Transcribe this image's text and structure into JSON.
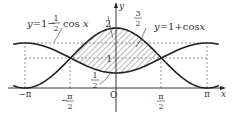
{
  "chart_data": {
    "type": "line",
    "title": "",
    "xlabel": "x",
    "ylabel": "y",
    "series": [
      {
        "name": "y=1+cos x",
        "expression": "1+cos(x)",
        "label": "y=1+cos x"
      },
      {
        "name": "y=1-1/2 cos x",
        "expression": "1-0.5*cos(x)",
        "label": "y=1-1/2 cos x"
      }
    ],
    "shaded_region": {
      "between": [
        "y=1+cos x",
        "y=1-1/2 cos x"
      ],
      "x_range": [
        "-π/2",
        "π/2"
      ],
      "pattern": "hatched"
    },
    "x_ticks": [
      "-π",
      "-π/2",
      "O",
      "π/2",
      "π"
    ],
    "y_ticks": [
      "1/2",
      "1",
      "3/2",
      "2"
    ],
    "xlim": [
      -3.4,
      3.5
    ],
    "ylim": [
      -0.6,
      2.7
    ],
    "grid": false,
    "guides": "dashed lines at y=1/2(not), y=1, y=3/2 and vertical at x=±π/2, ±π"
  },
  "labels": {
    "curve_a_prefix": "y=1−",
    "curve_a_num": "1",
    "curve_a_den": "2",
    "curve_a_suffix": "cos x",
    "curve_b": "y=1+cos x",
    "three_halves_num": "3",
    "three_halves_den": "2",
    "half_num": "1",
    "half_den": "2",
    "two": "2",
    "one": "1",
    "origin": "O",
    "x_axis": "x",
    "y_axis": "y",
    "neg_pi": "−π",
    "pi": "π",
    "neg_half_pi_num": "π",
    "neg_half_pi_den": "2",
    "neg_sign": "−",
    "half_pi_num": "π",
    "half_pi_den": "2"
  }
}
